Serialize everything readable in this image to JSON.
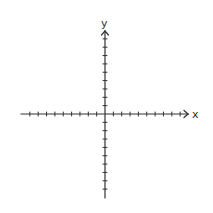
{
  "diagram": {
    "type": "coordinate-plane",
    "x_axis": {
      "label": "x",
      "ticks_negative": 9,
      "ticks_positive": 9,
      "arrow_right": true,
      "arrow_left": false
    },
    "y_axis": {
      "label": "y",
      "ticks_positive": 9,
      "ticks_negative": 9,
      "arrow_top": true,
      "arrow_bottom": false
    },
    "colors": {
      "axis": "#333333",
      "background": "#ffffff"
    },
    "geometry": {
      "origin_x": 105,
      "origin_y": 114,
      "tick_spacing": 8.35,
      "x_start": 21,
      "x_end": 188,
      "y_start": 31,
      "y_end": 198,
      "tick_half_length": 2
    }
  }
}
